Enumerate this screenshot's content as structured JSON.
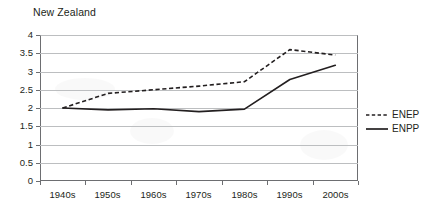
{
  "chart_data": {
    "type": "line",
    "title": "New Zealand",
    "xlabel": "",
    "ylabel": "",
    "categories": [
      "1940s",
      "1950s",
      "1960s",
      "1970s",
      "1980s",
      "1990s",
      "2000s"
    ],
    "series": [
      {
        "name": "ENEP",
        "style": "dashed",
        "color": "#231f20",
        "values": [
          2.0,
          2.4,
          2.5,
          2.6,
          2.72,
          3.6,
          3.45
        ]
      },
      {
        "name": "ENPP",
        "style": "solid",
        "color": "#231f20",
        "values": [
          2.0,
          1.95,
          1.98,
          1.9,
          1.97,
          2.78,
          3.17
        ]
      }
    ],
    "ylim": [
      0,
      4
    ],
    "yticks": [
      0,
      0.5,
      1,
      1.5,
      2,
      2.5,
      3,
      3.5,
      4
    ],
    "ytick_labels": [
      "0",
      "0.5",
      "1",
      "1.5",
      "2",
      "2.5",
      "3",
      "3.5",
      "4"
    ],
    "grid": true,
    "grid_axis": "y",
    "legend_position": "right"
  },
  "legend": {
    "entries": [
      {
        "label": "ENEP",
        "style": "dashed"
      },
      {
        "label": "ENPP",
        "style": "solid"
      }
    ]
  }
}
